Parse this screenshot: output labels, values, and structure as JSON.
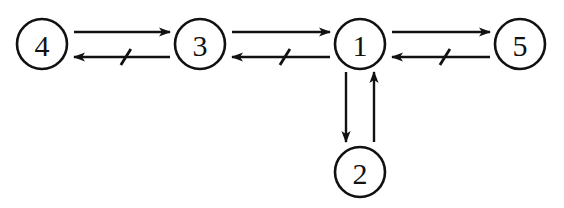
{
  "diagram": {
    "background_color": "#ffffff",
    "stroke_color": "#111111",
    "width": 564,
    "height": 208,
    "nodes": [
      {
        "id": "4",
        "label": "4",
        "cx": 42,
        "cy": 44,
        "r": 25
      },
      {
        "id": "3",
        "label": "3",
        "cx": 200,
        "cy": 44,
        "r": 25
      },
      {
        "id": "1",
        "label": "1",
        "cx": 360,
        "cy": 44,
        "r": 25
      },
      {
        "id": "5",
        "label": "5",
        "cx": 520,
        "cy": 44,
        "r": 25
      },
      {
        "id": "2",
        "label": "2",
        "cx": 360,
        "cy": 172,
        "r": 25
      }
    ],
    "edges": [
      {
        "id": "edge-4-3-forward",
        "from": "4",
        "to": "3",
        "orientation": "horizontal",
        "direction": "right",
        "tick": false,
        "x1": 74,
        "y1": 32,
        "x2": 170,
        "y2": 32
      },
      {
        "id": "edge-3-4-reverse",
        "from": "3",
        "to": "4",
        "orientation": "horizontal",
        "direction": "left",
        "tick": true,
        "tick_position": 0.46,
        "x1": 170,
        "y1": 57,
        "x2": 74,
        "y2": 57
      },
      {
        "id": "edge-3-1-forward",
        "from": "3",
        "to": "1",
        "orientation": "horizontal",
        "direction": "right",
        "tick": false,
        "x1": 232,
        "y1": 32,
        "x2": 330,
        "y2": 32
      },
      {
        "id": "edge-1-3-reverse",
        "from": "1",
        "to": "3",
        "orientation": "horizontal",
        "direction": "left",
        "tick": true,
        "tick_position": 0.46,
        "x1": 330,
        "y1": 57,
        "x2": 232,
        "y2": 57
      },
      {
        "id": "edge-1-5-forward",
        "from": "1",
        "to": "5",
        "orientation": "horizontal",
        "direction": "right",
        "tick": false,
        "x1": 392,
        "y1": 32,
        "x2": 490,
        "y2": 32
      },
      {
        "id": "edge-5-1-reverse",
        "from": "5",
        "to": "1",
        "orientation": "horizontal",
        "direction": "left",
        "tick": true,
        "tick_position": 0.46,
        "x1": 490,
        "y1": 57,
        "x2": 392,
        "y2": 57
      },
      {
        "id": "edge-1-2-down",
        "from": "1",
        "to": "2",
        "orientation": "vertical",
        "direction": "down",
        "tick": false,
        "x1": 346,
        "y1": 72,
        "x2": 346,
        "y2": 142
      },
      {
        "id": "edge-2-1-up",
        "from": "2",
        "to": "1",
        "orientation": "vertical",
        "direction": "up",
        "tick": false,
        "x1": 374,
        "y1": 142,
        "x2": 374,
        "y2": 72
      }
    ]
  }
}
